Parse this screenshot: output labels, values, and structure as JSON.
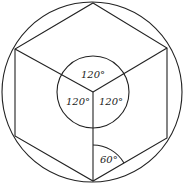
{
  "diagram": {
    "labels": {
      "top_angle": "120°",
      "left_angle": "120°",
      "right_angle": "120°",
      "bottom_angle": "60°"
    },
    "colors": {
      "stroke": "#222222",
      "background": "#ffffff"
    }
  }
}
